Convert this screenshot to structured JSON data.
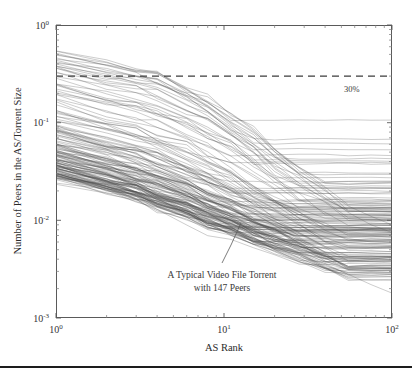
{
  "chart_data": {
    "type": "line",
    "title": "",
    "subtitle": "",
    "xlabel": "AS Rank",
    "ylabel": "Number of Peers in the AS/Torrent Size",
    "xscale": "log",
    "yscale": "log",
    "xlim": [
      1,
      100
    ],
    "ylim": [
      0.001,
      1
    ],
    "grid": false,
    "legend": null,
    "legend_position": "none",
    "xtick_labels": [
      "10^0",
      "10^1",
      "10^2"
    ],
    "xtick_values": [
      1,
      10,
      100
    ],
    "ytick_labels": [
      "10^0",
      "10^-1",
      "10^-2",
      "10^-3"
    ],
    "ytick_values": [
      1,
      0.1,
      0.01,
      0.001
    ],
    "xtick_mantissas": [
      "10",
      "10",
      "10"
    ],
    "xtick_exponents": [
      "0",
      "1",
      "2"
    ],
    "ytick_mantissas": [
      "10",
      "10",
      "10",
      "10"
    ],
    "ytick_exponents": [
      "0",
      "-1",
      "-2",
      "-3"
    ],
    "reference_line": {
      "label": "30%",
      "value": 0.3,
      "orientation": "horizontal",
      "style": "dashed"
    },
    "annotations": [
      {
        "text_line1": "A Typical Video File Torrent",
        "text_line2": "with 147 Peers",
        "x": 8.5,
        "y": 0.0018,
        "points_to_x": 13.0,
        "points_to_y": 0.0105
      }
    ],
    "series_count": 150,
    "series_description": "Per-torrent curves of fraction of peers in the AS versus AS rank; each line is one torrent, decreasing and flattening into horizontal plateaus at high rank.",
    "series": [
      {
        "name": "torrent-high-1",
        "x": [
          1,
          2,
          3,
          4,
          6,
          8,
          11,
          15,
          20,
          28,
          40,
          55,
          75,
          100
        ],
        "values": [
          0.42,
          0.33,
          0.3,
          0.28,
          0.2,
          0.15,
          0.1,
          0.07,
          0.045,
          0.03,
          0.02,
          0.014,
          0.011,
          0.009
        ]
      },
      {
        "name": "torrent-high-2",
        "x": [
          1,
          2,
          3,
          4,
          6,
          8,
          11,
          15,
          20,
          28,
          40,
          55,
          75,
          100
        ],
        "values": [
          0.4,
          0.3,
          0.26,
          0.23,
          0.17,
          0.13,
          0.09,
          0.06,
          0.04,
          0.027,
          0.018,
          0.012,
          0.009,
          0.0075
        ]
      },
      {
        "name": "torrent-median",
        "x": [
          1,
          2,
          3,
          4,
          6,
          8,
          11,
          15,
          20,
          28,
          40,
          55,
          75,
          100
        ],
        "values": [
          0.095,
          0.07,
          0.058,
          0.05,
          0.038,
          0.03,
          0.023,
          0.017,
          0.013,
          0.0095,
          0.0075,
          0.0065,
          0.006,
          0.006
        ]
      },
      {
        "name": "torrent-low-1",
        "x": [
          1,
          2,
          3,
          4,
          6,
          8,
          11,
          15,
          20,
          28,
          40,
          55,
          75,
          100
        ],
        "values": [
          0.035,
          0.028,
          0.024,
          0.021,
          0.017,
          0.014,
          0.012,
          0.0095,
          0.008,
          0.0068,
          0.0068,
          0.0068,
          0.0068,
          0.0068
        ]
      },
      {
        "name": "torrent-low-2",
        "x": [
          1,
          2,
          3,
          4,
          6,
          8,
          11,
          15,
          20,
          28,
          40,
          55,
          75,
          100
        ],
        "values": [
          0.03,
          0.022,
          0.018,
          0.015,
          0.012,
          0.0095,
          0.008,
          0.0065,
          0.0055,
          0.0045,
          0.0035,
          0.0028,
          0.0022,
          0.0018
        ]
      }
    ]
  },
  "axes": {
    "x": {
      "title": "AS Rank",
      "ticks": [
        {
          "mantissa": "10",
          "exponent": "0"
        },
        {
          "mantissa": "10",
          "exponent": "1"
        },
        {
          "mantissa": "10",
          "exponent": "2"
        }
      ]
    },
    "y": {
      "title": "Number of Peers in the AS/Torrent Size",
      "ticks": [
        {
          "mantissa": "10",
          "exponent": "0"
        },
        {
          "mantissa": "10",
          "exponent": "-1"
        },
        {
          "mantissa": "10",
          "exponent": "-2"
        },
        {
          "mantissa": "10",
          "exponent": "-3"
        }
      ]
    }
  },
  "overlays": {
    "reference_label": "30%",
    "annotation_line1": "A Typical Video File Torrent",
    "annotation_line2": "with 147 Peers"
  },
  "colors": {
    "background": "#ffffff",
    "curve": "#4a4a4a",
    "frame": "#5a5a5a",
    "reference_line": "#3c3c3c",
    "text": "#2b2b2b",
    "bottom_rule": "#1d1d1d"
  }
}
